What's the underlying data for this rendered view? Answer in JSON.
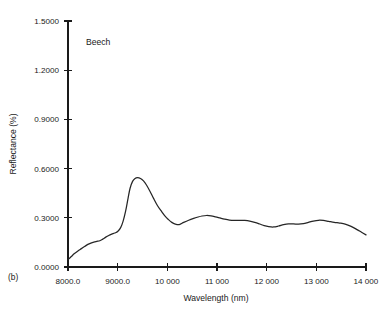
{
  "figure": {
    "panel_label": "(b)",
    "annotation": "Beech",
    "ink_color": "#262626",
    "axis_color": "#1a1a1a",
    "background": "#ffffff"
  },
  "chart_data": {
    "type": "line",
    "title": "",
    "subtitle": "",
    "annotations": [
      "Beech",
      "(b)"
    ],
    "xlabel": "Wavelength (nm)",
    "ylabel": "Reflectance (%)",
    "xlim": [
      8000,
      14000
    ],
    "ylim": [
      0.0,
      1.5
    ],
    "grid": false,
    "legend": null,
    "legend_position": "none",
    "xticks": [
      8000,
      9000,
      10000,
      11000,
      12000,
      13000,
      14000
    ],
    "xticklabels": [
      "8000.0",
      "9000.0",
      "10 000",
      "11 000",
      "12 000",
      "13 000",
      "14 000"
    ],
    "yticks": [
      0.0,
      0.3,
      0.6,
      0.9,
      1.2,
      1.5
    ],
    "yticklabels": [
      "0.0000",
      "0.3000",
      "0.6000",
      "0.9000",
      "1.2000",
      "1.5000"
    ],
    "series": [
      {
        "name": "Beech",
        "color": "#262626",
        "x": [
          8000,
          8060,
          8130,
          8200,
          8270,
          8340,
          8400,
          8460,
          8520,
          8580,
          8640,
          8700,
          8760,
          8820,
          8880,
          8940,
          9000,
          9060,
          9110,
          9160,
          9210,
          9250,
          9300,
          9350,
          9400,
          9460,
          9520,
          9580,
          9650,
          9720,
          9800,
          9880,
          9950,
          10020,
          10090,
          10160,
          10240,
          10330,
          10430,
          10530,
          10620,
          10700,
          10790,
          10880,
          10970,
          11060,
          11150,
          11250,
          11350,
          11450,
          11560,
          11660,
          11760,
          11860,
          11950,
          12040,
          12140,
          12240,
          12340,
          12440,
          12540,
          12640,
          12740,
          12840,
          12940,
          13040,
          13140,
          13250,
          13360,
          13470,
          13580,
          13700,
          13820,
          13910,
          14000
        ],
        "y": [
          0.045,
          0.062,
          0.082,
          0.098,
          0.112,
          0.126,
          0.138,
          0.146,
          0.152,
          0.156,
          0.16,
          0.17,
          0.182,
          0.192,
          0.2,
          0.207,
          0.216,
          0.24,
          0.28,
          0.34,
          0.42,
          0.48,
          0.522,
          0.54,
          0.545,
          0.54,
          0.525,
          0.5,
          0.462,
          0.42,
          0.375,
          0.34,
          0.312,
          0.29,
          0.272,
          0.262,
          0.259,
          0.272,
          0.285,
          0.296,
          0.305,
          0.311,
          0.314,
          0.312,
          0.306,
          0.299,
          0.292,
          0.286,
          0.284,
          0.285,
          0.284,
          0.28,
          0.272,
          0.262,
          0.252,
          0.246,
          0.244,
          0.25,
          0.258,
          0.263,
          0.263,
          0.261,
          0.264,
          0.272,
          0.28,
          0.285,
          0.284,
          0.278,
          0.272,
          0.268,
          0.262,
          0.248,
          0.228,
          0.212,
          0.196
        ]
      }
    ],
    "key_points": {
      "start": {
        "x": 8000,
        "y": 0.045
      },
      "peak": {
        "x": 9400,
        "y": 0.545
      },
      "trough_after_peak": {
        "x": 10240,
        "y": 0.259
      },
      "plateau_max": {
        "x": 10790,
        "y": 0.314
      },
      "secondary_min": {
        "x": 12140,
        "y": 0.244
      },
      "secondary_max": {
        "x": 12940,
        "y": 0.285
      },
      "end": {
        "x": 14000,
        "y": 0.196
      }
    }
  }
}
